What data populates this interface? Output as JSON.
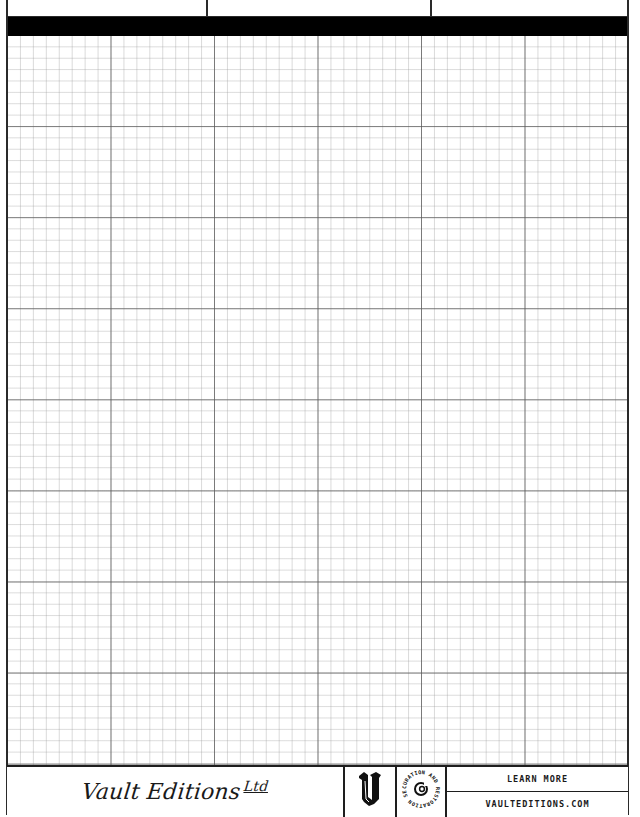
{
  "page": {
    "type": "graph-paper",
    "background_color": "#ffffff",
    "ink_color": "#000000"
  },
  "header": {
    "boxes": [
      {
        "label": ""
      },
      {
        "label": ""
      },
      {
        "label": ""
      }
    ],
    "band_color": "#000000"
  },
  "grid": {
    "major_columns": 6,
    "major_rows": 8,
    "minor_per_major_x": 8,
    "minor_per_major_y": 8,
    "major_line_color": "#5a5a5a",
    "minor_line_color": "#c8c8c8"
  },
  "footer": {
    "brand": {
      "name": "Vault Editions",
      "suffix": "Ltd"
    },
    "logo_icon": "gothic-letter-v-icon",
    "badge": {
      "icon": "restoration-badge-icon",
      "ring_text": "CURATION AND RESTORATION SERVICES"
    },
    "links": {
      "learn_more": "LEARN MORE",
      "website": "VAULTEDITIONS.COM"
    }
  }
}
